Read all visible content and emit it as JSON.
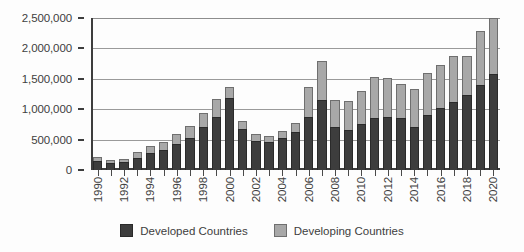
{
  "chart_data": {
    "type": "bar",
    "stacked": true,
    "title": "",
    "subtitle": "",
    "xlabel": "",
    "ylabel": "",
    "ylim": [
      0,
      2500000
    ],
    "ytick_labels": [
      "0",
      "500,000",
      "1,000,000",
      "1,500,000",
      "2,000,000",
      "2,500,000"
    ],
    "ytick_values": [
      0,
      500000,
      1000000,
      1500000,
      2000000,
      2500000
    ],
    "grid": true,
    "legend_position": "bottom",
    "categories": [
      "1990",
      "1991",
      "1992",
      "1993",
      "1994",
      "1995",
      "1996",
      "1997",
      "1998",
      "1999",
      "2000",
      "2001",
      "2002",
      "2003",
      "2004",
      "2005",
      "2006",
      "2007",
      "2008",
      "2009",
      "2010",
      "2011",
      "2012",
      "2013",
      "2014",
      "2015",
      "2016",
      "2017",
      "2018",
      "2019",
      "2020"
    ],
    "xtick_labels_shown": [
      "1990",
      "1992",
      "1994",
      "1996",
      "1998",
      "2000",
      "2002",
      "2004",
      "2006",
      "2008",
      "2010",
      "2012",
      "2014",
      "2016",
      "2018",
      "2020"
    ],
    "series": [
      {
        "name": "Developed Countries",
        "color": "#3d3d3d",
        "values": [
          150000,
          120000,
          130000,
          200000,
          280000,
          330000,
          420000,
          520000,
          700000,
          880000,
          1180000,
          680000,
          480000,
          460000,
          520000,
          620000,
          880000,
          1150000,
          700000,
          660000,
          760000,
          860000,
          880000,
          860000,
          700000,
          900000,
          1020000,
          1120000,
          1230000,
          1400000,
          1580000
        ]
      },
      {
        "name": "Developing Countries",
        "color": "#a8a8a8",
        "values": [
          60000,
          40000,
          50000,
          90000,
          110000,
          130000,
          170000,
          200000,
          230000,
          280000,
          180000,
          130000,
          120000,
          100000,
          120000,
          160000,
          480000,
          650000,
          450000,
          470000,
          540000,
          670000,
          640000,
          560000,
          640000,
          700000,
          700000,
          760000,
          640000,
          890000,
          920000
        ]
      }
    ],
    "totals": [
      210000,
      160000,
      180000,
      290000,
      390000,
      460000,
      590000,
      720000,
      930000,
      1160000,
      1360000,
      810000,
      600000,
      560000,
      640000,
      780000,
      1360000,
      1800000,
      1150000,
      1130000,
      1300000,
      1530000,
      1520000,
      1420000,
      1340000,
      1600000,
      1720000,
      1880000,
      1870000,
      2290000,
      2500000
    ]
  },
  "legend": {
    "items": [
      {
        "label": "Developed Countries",
        "color": "#3d3d3d"
      },
      {
        "label": "Developing Countries",
        "color": "#a8a8a8"
      }
    ]
  }
}
